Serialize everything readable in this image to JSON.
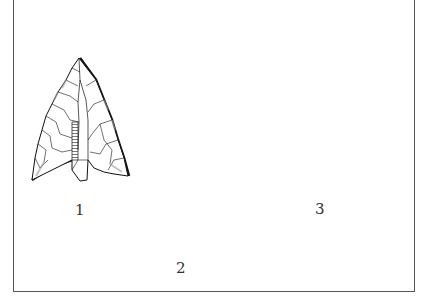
{
  "plate": {
    "description": "Line drawing of three prehistoric stone tools",
    "background": "#ffffff",
    "ink": "#111111",
    "frame_color": "#555555"
  },
  "figures": [
    {
      "id": 1,
      "label": "1",
      "name": "barbed arrowhead"
    },
    {
      "id": 2,
      "label": "2",
      "name": "leaf-shaped blade"
    },
    {
      "id": 3,
      "label": "3",
      "name": "scraper"
    }
  ]
}
